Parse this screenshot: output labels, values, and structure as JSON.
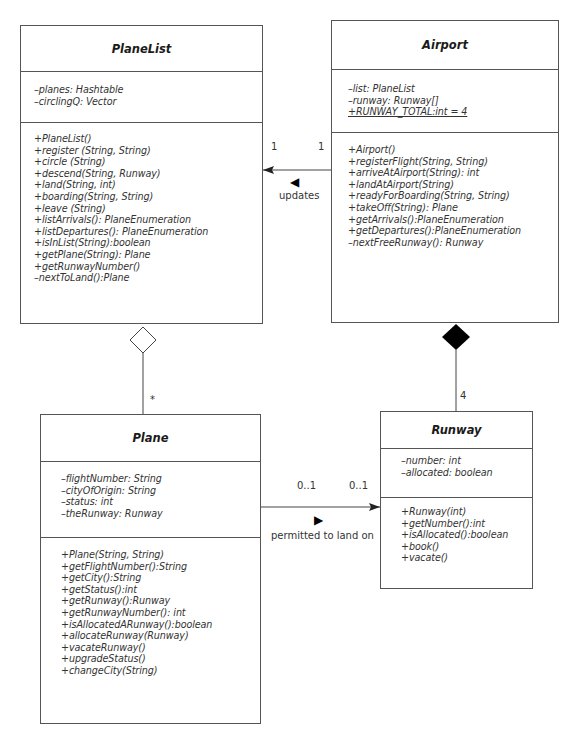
{
  "diagram": {
    "type": "UML class diagram",
    "classes": {
      "planelist": {
        "name": "PlaneList",
        "attributes": [
          "–planes: Hashtable",
          "–circlingQ: Vector"
        ],
        "operations": [
          "+PlaneList()",
          "+register (String, String)",
          "+circle (String)",
          "+descend(String, Runway)",
          "+land(String, int)",
          "+boarding(String, String)",
          "+leave (String)",
          "+listArrivals(): PlaneEnumeration",
          "+listDepartures(): PlaneEnumeration",
          "+isInList(String):boolean",
          "+getPlane(String): Plane",
          "+getRunwayNumber()",
          "–nextToLand():Plane"
        ]
      },
      "airport": {
        "name": "Airport",
        "attributes": [
          "–list: PlaneList",
          "–runway: Runway[]",
          "+RUNWAY_TOTAL:int = 4"
        ],
        "operations": [
          "+Airport()",
          "+registerFlight(String, String)",
          "+arriveAtAirport(String): int",
          "+landAtAirport(String)",
          "+readyForBoarding(String, String)",
          "+takeOff(String): Plane",
          "+getArrivals():PlaneEnumeration",
          "+getDepartures():PlaneEnumeration",
          "–nextFreeRunway(): Runway"
        ]
      },
      "plane": {
        "name": "Plane",
        "attributes": [
          "–flightNumber: String",
          "–cityOfOrigin: String",
          "–status: int",
          "–theRunway: Runway"
        ],
        "operations": [
          "+Plane(String, String)",
          "+getFlightNumber():String",
          "+getCity():String",
          "+getStatus():int",
          "+getRunway():Runway",
          "+getRunwayNumber(): int",
          "+isAllocatedARunway():boolean",
          "+allocateRunway(Runway)",
          "+vacateRunway()",
          "+upgradeStatus()",
          "+changeCity(String)"
        ]
      },
      "runway": {
        "name": "Runway",
        "attributes": [
          "–number: int",
          "–allocated: boolean"
        ],
        "operations": [
          "+Runway(int)",
          "+getNumber():int",
          "+isAllocated():boolean",
          "+book()",
          "+vacate()"
        ]
      }
    },
    "relationships": {
      "airport_planelist": {
        "kind": "association",
        "label": "updates",
        "direction_glyph": "◀",
        "multiplicity_planelist": "1",
        "multiplicity_airport": "1"
      },
      "planelist_plane": {
        "kind": "aggregation",
        "multiplicity_plane": "*"
      },
      "airport_runway": {
        "kind": "composition",
        "multiplicity_runway": "4"
      },
      "plane_runway": {
        "kind": "association",
        "label": "permitted to land on",
        "direction_glyph": "▶",
        "multiplicity_plane": "0..1",
        "multiplicity_runway": "0..1"
      }
    }
  }
}
